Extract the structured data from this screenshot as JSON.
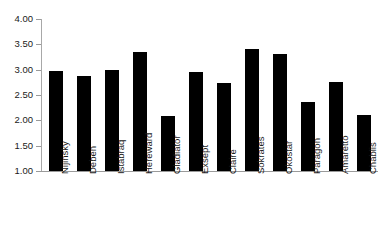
{
  "chart_data": {
    "type": "bar",
    "title": "",
    "subtitle": "",
    "xlabel": "",
    "ylabel": "",
    "categories": [
      "Nijinsky",
      "Deben",
      "Istabraq",
      "Hereward",
      "Gladiator",
      "Exsept",
      "Claire",
      "Sokrates",
      "Okostar",
      "Paragon",
      "Amaretto",
      "Chablis"
    ],
    "values": [
      2.97,
      2.87,
      2.99,
      3.35,
      2.09,
      2.95,
      2.73,
      3.4,
      3.31,
      2.37,
      2.75,
      2.11
    ],
    "ylim": [
      1.0,
      4.0
    ],
    "ytick_labels": [
      "4.00",
      "3.50",
      "3.00",
      "2.50",
      "2.00",
      "1.50",
      "1.00"
    ],
    "ytick_values": [
      4.0,
      3.5,
      3.0,
      2.5,
      2.0,
      1.5,
      1.0
    ],
    "grid": false,
    "legend": false,
    "legend_position": "none",
    "bar_color": "#000000",
    "axis_color": "#9a9a9a",
    "background_color": "#ffffff"
  }
}
